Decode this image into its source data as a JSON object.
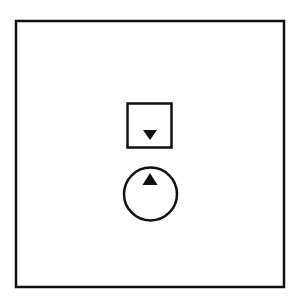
{
  "diagram": {
    "colors": {
      "stroke": "#111111",
      "background": "#ffffff"
    },
    "outer_frame": {
      "x": 16,
      "y": 21,
      "width": 268,
      "height": 266,
      "stroke_width": 2.5
    },
    "square_button": {
      "x": 127.5,
      "y": 103.5,
      "width": 44,
      "height": 44,
      "stroke_width": 2.5,
      "icon": "triangle-down-icon"
    },
    "circle_button": {
      "cx": 150.5,
      "cy": 194,
      "r": 26.5,
      "stroke_width": 2.5,
      "icon": "triangle-up-icon"
    }
  }
}
